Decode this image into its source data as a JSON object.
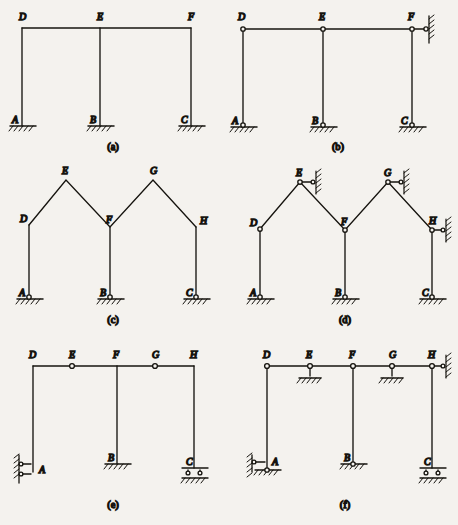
{
  "figure": {
    "background_color": "#f4f2ee",
    "ink_color": "#16140f",
    "panels": [
      {
        "id": "a",
        "caption": "(a)",
        "description": "Rigid three-column frame with fixed supports",
        "joint_labels": [
          "D",
          "E",
          "F",
          "A",
          "B",
          "C"
        ],
        "supports": [
          "fixed",
          "fixed",
          "fixed"
        ],
        "hinges": []
      },
      {
        "id": "b",
        "caption": "(b)",
        "description": "Three-column frame with pin joints at all nodes and a horizontal link at F",
        "joint_labels": [
          "D",
          "E",
          "F",
          "A",
          "B",
          "C"
        ],
        "supports": [
          "pin",
          "pin",
          "pin"
        ],
        "hinges": [
          "D",
          "E",
          "F",
          "A",
          "B",
          "C"
        ],
        "links": [
          "F-horizontal-right"
        ]
      },
      {
        "id": "c",
        "caption": "(c)",
        "description": "Two-bay gabled frame, rigid joints, pin supports",
        "joint_labels": [
          "E",
          "G",
          "D",
          "F",
          "H",
          "A",
          "B",
          "C"
        ],
        "supports": [
          "pin",
          "pin",
          "pin"
        ],
        "hinges": []
      },
      {
        "id": "d",
        "caption": "(d)",
        "description": "Two-bay gabled frame with hinges and horizontal links at E, G and H",
        "joint_labels": [
          "E",
          "G",
          "D",
          "F",
          "H",
          "A",
          "B",
          "C"
        ],
        "supports": [
          "pin",
          "pin",
          "pin"
        ],
        "hinges": [
          "D",
          "E",
          "F",
          "G",
          "H"
        ],
        "links": [
          "E-horizontal-right",
          "G-horizontal-right",
          "H-horizontal-right"
        ]
      },
      {
        "id": "e",
        "caption": "(e)",
        "description": "Continuous beam on columns with hinges at E and G, double link at A, fixed at B, double roller at C",
        "joint_labels": [
          "D",
          "E",
          "F",
          "G",
          "H",
          "A",
          "B",
          "C"
        ],
        "supports": [
          "double-link-horizontal",
          "fixed",
          "double-roller"
        ],
        "hinges": [
          "E",
          "G"
        ]
      },
      {
        "id": "f",
        "caption": "(f)",
        "description": "Beam with hinges at D, E, F, G, H; link and pin at A, vertical link supports at E and G, fixed at B, double roller at C, horizontal link at H",
        "joint_labels": [
          "D",
          "E",
          "F",
          "G",
          "H",
          "A",
          "B",
          "C"
        ],
        "supports": [
          "link-and-pin",
          "fixed",
          "double-roller"
        ],
        "hinges": [
          "D",
          "E",
          "F",
          "G",
          "H",
          "A"
        ],
        "links": [
          "A-horizontal-left",
          "E-vertical-down",
          "G-vertical-down",
          "H-horizontal-right"
        ]
      }
    ]
  }
}
